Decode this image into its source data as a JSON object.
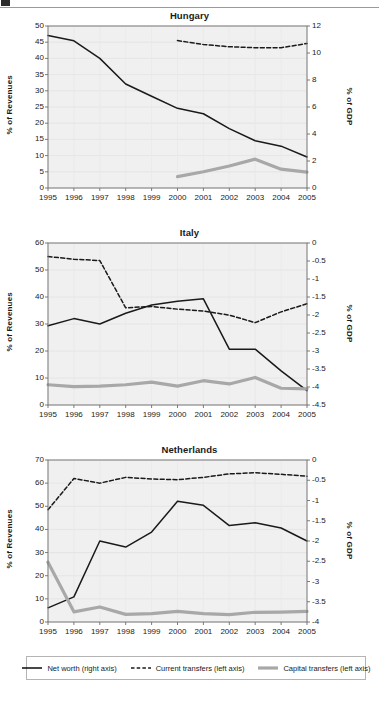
{
  "page": {
    "header_artifact": "",
    "legend": {
      "items": [
        {
          "label": "Net worth (right axis)",
          "style": "solid",
          "color": "#1a1a1a",
          "width": 1.6
        },
        {
          "label": "Current transfers (left axis)",
          "style": "dashed",
          "color": "#1a1a1a",
          "width": 1.6
        },
        {
          "label": "Capital transfers (left axis)",
          "style": "solid",
          "color": "#a8a8a8",
          "width": 3.2
        }
      ]
    }
  },
  "chart_data": [
    {
      "type": "line",
      "title": "Hungary",
      "xlabel": "",
      "ylabel": "% of Revenues",
      "y2label": "% of GDP",
      "x": [
        1995,
        1996,
        1997,
        1998,
        1999,
        2000,
        2001,
        2002,
        2003,
        2004,
        2005
      ],
      "xticklabels": [
        "1995",
        "1996",
        "1997",
        "1998",
        "1999",
        "2000",
        "2001",
        "2002",
        "2003",
        "2004",
        "2005"
      ],
      "ylim": [
        0,
        50
      ],
      "yticks": [
        0,
        5,
        10,
        15,
        20,
        25,
        30,
        35,
        40,
        45,
        50
      ],
      "y2lim": [
        0,
        12
      ],
      "y2ticks": [
        0,
        2,
        4,
        6,
        8,
        10,
        12
      ],
      "grid": true,
      "series": [
        {
          "name": "Net worth (right axis)",
          "axis": "right",
          "style": "solid",
          "color": "#1a1a1a",
          "values": [
            11.3,
            10.9,
            9.6,
            7.7,
            6.8,
            5.9,
            5.5,
            4.4,
            3.5,
            3.1,
            2.3
          ]
        },
        {
          "name": "Current transfers (left axis)",
          "axis": "left",
          "style": "dashed",
          "color": "#1a1a1a",
          "values": [
            null,
            null,
            null,
            null,
            null,
            45.5,
            44.3,
            43.6,
            43.3,
            43.3,
            44.6
          ]
        },
        {
          "name": "Capital transfers (left axis)",
          "axis": "left",
          "style": "solid",
          "color": "#a8a8a8",
          "values": [
            null,
            null,
            null,
            null,
            null,
            3.5,
            5.0,
            6.8,
            8.9,
            5.8,
            4.9
          ]
        }
      ]
    },
    {
      "type": "line",
      "title": "Italy",
      "xlabel": "",
      "ylabel": "% of Revenues",
      "y2label": "% of GDP",
      "x": [
        1995,
        1996,
        1997,
        1998,
        1999,
        2000,
        2001,
        2002,
        2003,
        2004,
        2005
      ],
      "xticklabels": [
        "1995",
        "1996",
        "1997",
        "1998",
        "1999",
        "2000",
        "2001",
        "2002",
        "2003",
        "2004",
        "2005"
      ],
      "ylim": [
        0,
        60
      ],
      "yticks": [
        0,
        10,
        20,
        30,
        40,
        50,
        60
      ],
      "y2lim": [
        -4.5,
        0
      ],
      "y2ticks": [
        -4.5,
        -4,
        -3.5,
        -3,
        -2.5,
        -2,
        -1.5,
        -1,
        -0.5,
        0
      ],
      "y2ticklabels": [
        "-4.5",
        "-4",
        "-3.5",
        "-3",
        "-2.5",
        "-2",
        "-1.5",
        "-1",
        "-0.5",
        "0"
      ],
      "grid": true,
      "series": [
        {
          "name": "Net worth (right axis)",
          "axis": "right",
          "style": "solid",
          "color": "#1a1a1a",
          "values": [
            -2.3,
            -2.1,
            -2.25,
            -1.95,
            -1.72,
            -1.62,
            -1.55,
            -2.95,
            -2.95,
            -3.55,
            -4.1
          ]
        },
        {
          "name": "Current transfers (left axis)",
          "axis": "left",
          "style": "dashed",
          "color": "#1a1a1a",
          "values": [
            55.0,
            54.0,
            53.5,
            36.0,
            36.5,
            35.5,
            34.8,
            33.3,
            30.5,
            34.5,
            37.5
          ]
        },
        {
          "name": "Capital transfers (left axis)",
          "axis": "left",
          "style": "solid",
          "color": "#a8a8a8",
          "values": [
            7.5,
            6.8,
            7.0,
            7.5,
            8.5,
            7.0,
            9.0,
            7.8,
            10.2,
            6.2,
            6.0
          ]
        }
      ]
    },
    {
      "type": "line",
      "title": "Netherlands",
      "xlabel": "",
      "ylabel": "% of Revenues",
      "y2label": "% of GDP",
      "x": [
        1995,
        1996,
        1997,
        1998,
        1999,
        2000,
        2001,
        2002,
        2003,
        2004,
        2005
      ],
      "xticklabels": [
        "1995",
        "1996",
        "1997",
        "1998",
        "1999",
        "2000",
        "2001",
        "2002",
        "2003",
        "2004",
        "2005"
      ],
      "ylim": [
        0,
        70
      ],
      "yticks": [
        0,
        10,
        20,
        30,
        40,
        50,
        60,
        70
      ],
      "y2lim": [
        -4,
        0
      ],
      "y2ticks": [
        -4,
        -3.5,
        -3,
        -2.5,
        -2,
        -1.5,
        -1,
        -0.5,
        0
      ],
      "y2ticklabels": [
        "-4",
        "-3.5",
        "-3",
        "-2.5",
        "-2",
        "-1.5",
        "-1",
        "-0.5",
        "0"
      ],
      "grid": true,
      "series": [
        {
          "name": "Net worth (right axis)",
          "axis": "right",
          "style": "solid",
          "color": "#1a1a1a",
          "values": [
            -3.65,
            -3.38,
            -2.0,
            -2.15,
            -1.78,
            -1.02,
            -1.12,
            -1.62,
            -1.55,
            -1.68,
            -2.0
          ]
        },
        {
          "name": "Current transfers (left axis)",
          "axis": "left",
          "style": "dashed",
          "color": "#1a1a1a",
          "values": [
            48.5,
            62.0,
            60.0,
            62.5,
            61.8,
            61.5,
            62.5,
            64.0,
            64.5,
            63.8,
            63.0
          ]
        },
        {
          "name": "Capital transfers (left axis)",
          "axis": "left",
          "style": "solid",
          "color": "#a8a8a8",
          "values": [
            25.8,
            4.4,
            6.5,
            3.3,
            3.6,
            4.6,
            3.6,
            3.2,
            4.2,
            4.3,
            4.6
          ]
        }
      ]
    }
  ]
}
